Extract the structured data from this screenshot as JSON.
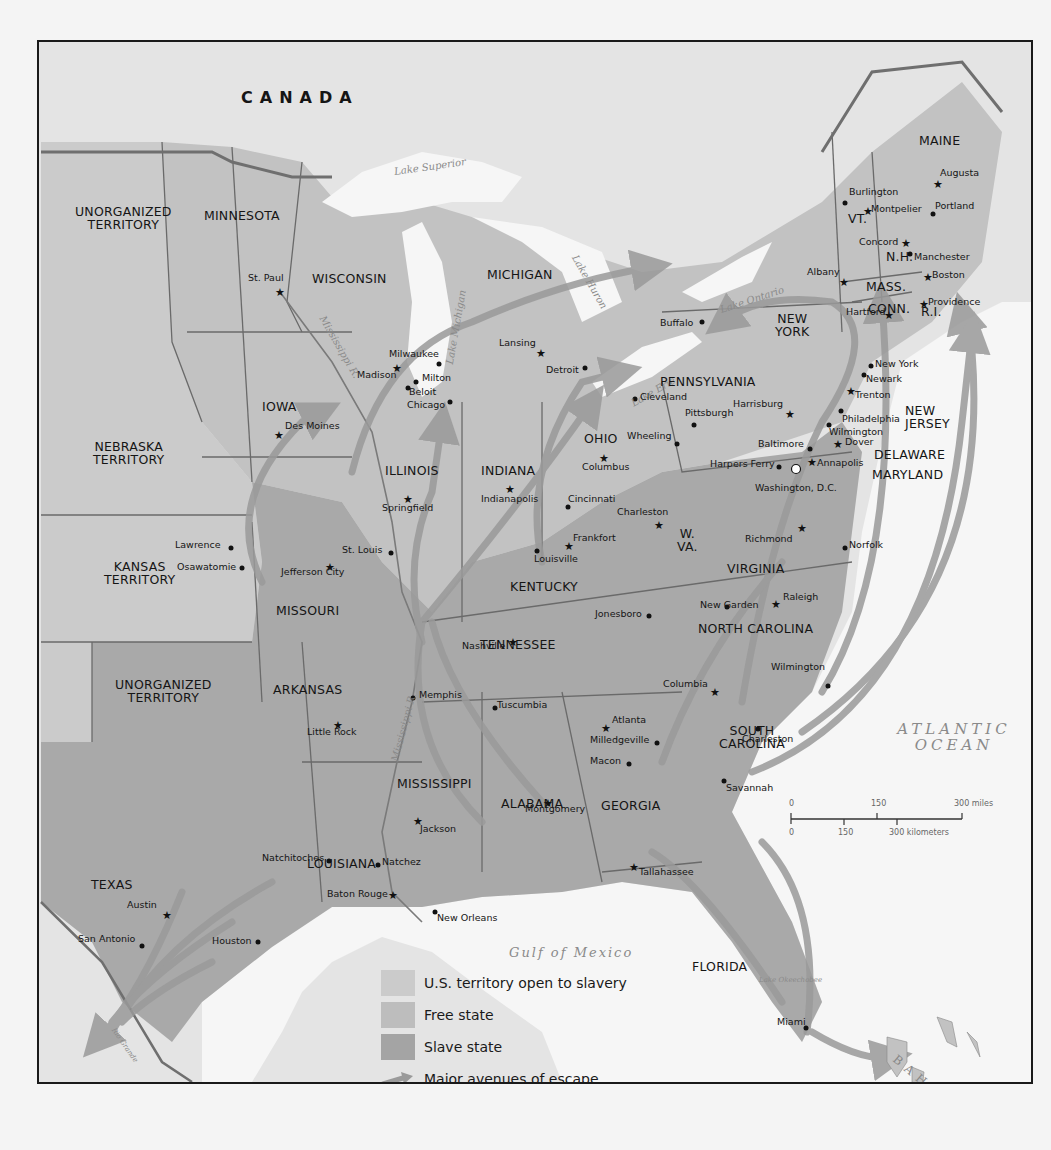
{
  "map": {
    "colors": {
      "territory_open_to_slavery": "#c8c8c8",
      "free_state": "#bfbfbf",
      "slave_state": "#a6a6a6",
      "escape_route": "#9a9a9a",
      "water": "#f6f6f6",
      "foreign_land": "#e2e2e2",
      "border": "#6a6a6a"
    },
    "countries": {
      "canada": "CANADA",
      "mexico": "MEXICO",
      "bahamas": "BAHAMAS"
    },
    "water_bodies": {
      "lake_superior": "Lake Superior",
      "lake_michigan": "Lake Michigan",
      "lake_huron": "Lake Huron",
      "lake_ontario": "Lake Ontario",
      "lake_erie": "Lake Erie",
      "lake_okeechobee": "Lake Okeechobee",
      "mississippi_r_north": "Mississippi R.",
      "mississippi_r_south": "Mississippi R.",
      "rio_grande": "Rio Grande",
      "gulf_of_mexico": "Gulf of Mexico",
      "atlantic_1": "ATLANTIC",
      "atlantic_2": "OCEAN"
    },
    "states": {
      "unorganized_north_1": "UNORGANIZED",
      "unorganized_north_2": "TERRITORY",
      "minnesota": "MINNESOTA",
      "wisconsin": "WISCONSIN",
      "michigan": "MICHIGAN",
      "iowa": "IOWA",
      "illinois": "ILLINOIS",
      "indiana": "INDIANA",
      "ohio": "OHIO",
      "nebraska_1": "NEBRASKA",
      "nebraska_2": "TERRITORY",
      "kansas_1": "KANSAS",
      "kansas_2": "TERRITORY",
      "missouri": "MISSOURI",
      "kentucky": "KENTUCKY",
      "wva_1": "W.",
      "wva_2": "VA.",
      "virginia": "VIRGINIA",
      "north_carolina": "NORTH CAROLINA",
      "tennessee": "TENNESSEE",
      "unorganized_south_1": "UNORGANIZED",
      "unorganized_south_2": "TERRITORY",
      "arkansas": "ARKANSAS",
      "mississippi": "MISSISSIPPI",
      "alabama": "ALABAMA",
      "georgia": "GEORGIA",
      "sc_1": "SOUTH",
      "sc_2": "CAROLINA",
      "louisiana": "LOUISIANA",
      "texas": "TEXAS",
      "florida": "FLORIDA",
      "pennsylvania": "PENNSYLVANIA",
      "ny_1": "NEW",
      "ny_2": "YORK",
      "nj_1": "NEW",
      "nj_2": "JERSEY",
      "delaware": "DELAWARE",
      "maryland": "MARYLAND",
      "maine": "MAINE",
      "vt": "VT.",
      "nh": "N.H.",
      "mass": "MASS.",
      "conn": "CONN.",
      "ri": "R.I."
    },
    "cities": [
      {
        "name": "St. Paul",
        "type": "capital",
        "x": 278,
        "y": 290,
        "lx": 248,
        "ly": 273
      },
      {
        "name": "Milwaukee",
        "type": "city",
        "x": 437,
        "y": 362,
        "lx": 389,
        "ly": 349
      },
      {
        "name": "Madison",
        "type": "capital",
        "x": 395,
        "y": 366,
        "lx": 357,
        "ly": 370
      },
      {
        "name": "Milton",
        "type": "city",
        "x": 414,
        "y": 380,
        "lx": 422,
        "ly": 373
      },
      {
        "name": "Beloit",
        "type": "city",
        "x": 406,
        "y": 386,
        "lx": 409,
        "ly": 387
      },
      {
        "name": "Chicago",
        "type": "city",
        "x": 448,
        "y": 400,
        "lx": 407,
        "ly": 400
      },
      {
        "name": "Des Moines",
        "type": "capital",
        "x": 277,
        "y": 433,
        "lx": 285,
        "ly": 421
      },
      {
        "name": "Springfield",
        "type": "capital",
        "x": 406,
        "y": 497,
        "lx": 382,
        "ly": 503
      },
      {
        "name": "Lansing",
        "type": "capital",
        "x": 539,
        "y": 351,
        "lx": 499,
        "ly": 338
      },
      {
        "name": "Detroit",
        "type": "city",
        "x": 583,
        "y": 366,
        "lx": 546,
        "ly": 365
      },
      {
        "name": "Buffalo",
        "type": "city",
        "x": 700,
        "y": 320,
        "lx": 660,
        "ly": 318
      },
      {
        "name": "Cleveland",
        "type": "city",
        "x": 633,
        "y": 397,
        "lx": 640,
        "ly": 392
      },
      {
        "name": "Wheeling",
        "type": "city",
        "x": 675,
        "y": 442,
        "lx": 627,
        "ly": 431
      },
      {
        "name": "Columbus",
        "type": "capital",
        "x": 602,
        "y": 456,
        "lx": 582,
        "ly": 462
      },
      {
        "name": "Indianapolis",
        "type": "capital",
        "x": 508,
        "y": 487,
        "lx": 481,
        "ly": 494
      },
      {
        "name": "Cincinnati",
        "type": "city",
        "x": 566,
        "y": 505,
        "lx": 568,
        "ly": 494
      },
      {
        "name": "Pittsburgh",
        "type": "city",
        "x": 692,
        "y": 423,
        "lx": 685,
        "ly": 408
      },
      {
        "name": "Harrisburg",
        "type": "capital",
        "x": 788,
        "y": 412,
        "lx": 733,
        "ly": 399
      },
      {
        "name": "Louisville",
        "type": "city",
        "x": 535,
        "y": 549,
        "lx": 534,
        "ly": 554
      },
      {
        "name": "Frankfort",
        "type": "capital",
        "x": 567,
        "y": 544,
        "lx": 573,
        "ly": 533
      },
      {
        "name": "Charleston",
        "type": "capital",
        "x": 657,
        "y": 523,
        "lx": 617,
        "ly": 507
      },
      {
        "name": "Harpers Ferry",
        "type": "city",
        "x": 777,
        "y": 465,
        "lx": 710,
        "ly": 459
      },
      {
        "name": "Washington, D.C.",
        "type": "national",
        "x": 794,
        "y": 467,
        "lx": 755,
        "ly": 483
      },
      {
        "name": "Baltimore",
        "type": "city",
        "x": 808,
        "y": 447,
        "lx": 758,
        "ly": 439
      },
      {
        "name": "Annapolis",
        "type": "capital",
        "x": 810,
        "y": 460,
        "lx": 817,
        "ly": 458
      },
      {
        "name": "Wilmington (DE)",
        "type": "city",
        "x": 827,
        "y": 423,
        "lx": 829,
        "ly": 427
      },
      {
        "name": "Dover",
        "type": "capital",
        "x": 836,
        "y": 442,
        "lx": 845,
        "ly": 437
      },
      {
        "name": "Philadelphia",
        "type": "city",
        "x": 839,
        "y": 409,
        "lx": 842,
        "ly": 414
      },
      {
        "name": "Trenton",
        "type": "capital",
        "x": 849,
        "y": 389,
        "lx": 855,
        "ly": 390
      },
      {
        "name": "Newark",
        "type": "city",
        "x": 862,
        "y": 373,
        "lx": 866,
        "ly": 374
      },
      {
        "name": "New York",
        "type": "city",
        "x": 869,
        "y": 364,
        "lx": 875,
        "ly": 359
      },
      {
        "name": "Albany",
        "type": "capital",
        "x": 842,
        "y": 280,
        "lx": 807,
        "ly": 267
      },
      {
        "name": "Hartford",
        "type": "capital",
        "x": 887,
        "y": 313,
        "lx": 846,
        "ly": 307
      },
      {
        "name": "Providence",
        "type": "capital",
        "x": 922,
        "y": 302,
        "lx": 928,
        "ly": 297
      },
      {
        "name": "Boston",
        "type": "capital",
        "x": 926,
        "y": 275,
        "lx": 932,
        "ly": 270
      },
      {
        "name": "Manchester",
        "type": "city",
        "x": 908,
        "y": 252,
        "lx": 914,
        "ly": 252
      },
      {
        "name": "Concord",
        "type": "capital",
        "x": 904,
        "y": 241,
        "lx": 859,
        "ly": 237
      },
      {
        "name": "Montpelier",
        "type": "capital",
        "x": 866,
        "y": 209,
        "lx": 871,
        "ly": 204
      },
      {
        "name": "Burlington",
        "type": "city",
        "x": 843,
        "y": 201,
        "lx": 849,
        "ly": 187
      },
      {
        "name": "Portland",
        "type": "city",
        "x": 931,
        "y": 212,
        "lx": 935,
        "ly": 201
      },
      {
        "name": "Augusta",
        "type": "capital",
        "x": 936,
        "y": 182,
        "lx": 940,
        "ly": 168
      },
      {
        "name": "Richmond",
        "type": "capital",
        "x": 800,
        "y": 526,
        "lx": 745,
        "ly": 534
      },
      {
        "name": "Norfolk",
        "type": "city",
        "x": 843,
        "y": 546,
        "lx": 849,
        "ly": 540
      },
      {
        "name": "Raleigh",
        "type": "capital",
        "x": 774,
        "y": 602,
        "lx": 783,
        "ly": 592
      },
      {
        "name": "New Garden",
        "type": "city",
        "x": 725,
        "y": 605,
        "lx": 700,
        "ly": 600
      },
      {
        "name": "Jonesboro",
        "type": "city",
        "x": 647,
        "y": 614,
        "lx": 595,
        "ly": 609
      },
      {
        "name": "Nashville",
        "type": "capital",
        "x": 511,
        "y": 640,
        "lx": 462,
        "ly": 641
      },
      {
        "name": "Memphis",
        "type": "city",
        "x": 411,
        "y": 696,
        "lx": 419,
        "ly": 690
      },
      {
        "name": "Tuscumbia",
        "type": "city",
        "x": 493,
        "y": 706,
        "lx": 497,
        "ly": 700
      },
      {
        "name": "Wilmington (NC)",
        "type": "city",
        "x": 826,
        "y": 684,
        "lx": 771,
        "ly": 662
      },
      {
        "name": "Columbia",
        "type": "capital",
        "x": 713,
        "y": 690,
        "lx": 663,
        "ly": 679
      },
      {
        "name": "Atlanta",
        "type": "capital",
        "x": 604,
        "y": 726,
        "lx": 612,
        "ly": 715
      },
      {
        "name": "Milledgeville",
        "type": "city",
        "x": 655,
        "y": 741,
        "lx": 590,
        "ly": 735
      },
      {
        "name": "Charleston (SC)",
        "type": "city",
        "x": 756,
        "y": 727,
        "lx": 742,
        "ly": 734
      },
      {
        "name": "Macon",
        "type": "city",
        "x": 627,
        "y": 762,
        "lx": 590,
        "ly": 756
      },
      {
        "name": "Savannah",
        "type": "city",
        "x": 722,
        "y": 779,
        "lx": 726,
        "ly": 783
      },
      {
        "name": "Montgomery",
        "type": "capital",
        "x": 546,
        "y": 801,
        "lx": 525,
        "ly": 804
      },
      {
        "name": "Little Rock",
        "type": "capital",
        "x": 336,
        "y": 723,
        "lx": 307,
        "ly": 727
      },
      {
        "name": "Jackson",
        "type": "capital",
        "x": 416,
        "y": 819,
        "lx": 420,
        "ly": 824
      },
      {
        "name": "Natchitoches",
        "type": "city",
        "x": 327,
        "y": 859,
        "lx": 262,
        "ly": 853
      },
      {
        "name": "Natchez",
        "type": "city",
        "x": 376,
        "y": 863,
        "lx": 382,
        "ly": 857
      },
      {
        "name": "Baton Rouge",
        "type": "capital",
        "x": 391,
        "y": 893,
        "lx": 327,
        "ly": 889
      },
      {
        "name": "New Orleans",
        "type": "city",
        "x": 433,
        "y": 910,
        "lx": 437,
        "ly": 913
      },
      {
        "name": "Tallahassee",
        "type": "capital",
        "x": 632,
        "y": 865,
        "lx": 639,
        "ly": 867
      },
      {
        "name": "Miami",
        "type": "city",
        "x": 804,
        "y": 1026,
        "lx": 777,
        "ly": 1017
      },
      {
        "name": "Austin",
        "type": "capital",
        "x": 165,
        "y": 913,
        "lx": 127,
        "ly": 900
      },
      {
        "name": "San Antonio",
        "type": "city",
        "x": 140,
        "y": 944,
        "lx": 78,
        "ly": 934
      },
      {
        "name": "Houston",
        "type": "city",
        "x": 256,
        "y": 940,
        "lx": 212,
        "ly": 936
      },
      {
        "name": "Lawrence",
        "type": "city",
        "x": 229,
        "y": 546,
        "lx": 175,
        "ly": 540
      },
      {
        "name": "Osawatomie",
        "type": "city",
        "x": 240,
        "y": 566,
        "lx": 177,
        "ly": 562
      },
      {
        "name": "Jefferson City",
        "type": "capital",
        "x": 328,
        "y": 565,
        "lx": 281,
        "ly": 567
      },
      {
        "name": "St. Louis",
        "type": "city",
        "x": 389,
        "y": 551,
        "lx": 342,
        "ly": 545
      }
    ],
    "scale_bar": {
      "miles_0": "0",
      "miles_150": "150",
      "miles_300": "300 miles",
      "km_0": "0",
      "km_150": "150",
      "km_300": "300 kilometers"
    },
    "legend": [
      {
        "label": "U.S. territory open to slavery",
        "swatch": "territory_open_to_slavery"
      },
      {
        "label": "Free state",
        "swatch": "free_state"
      },
      {
        "label": "Slave state",
        "swatch": "slave_state"
      },
      {
        "label": "Major avenues of escape",
        "swatch": "escape_route"
      }
    ]
  }
}
